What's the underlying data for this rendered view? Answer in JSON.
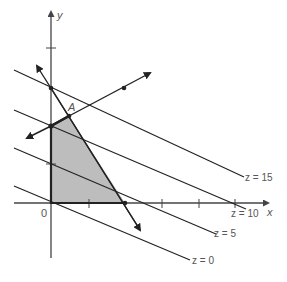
{
  "figure": {
    "colors": {
      "line": "#222222",
      "axis": "#444444",
      "region_fill": "#bdbdbd",
      "label": "#555555"
    },
    "axes": {
      "x_label": "x",
      "y_label": "y",
      "origin_label": "0"
    },
    "vertex_label": "A",
    "contours": [
      {
        "label": "z = 15",
        "value": 15
      },
      {
        "label": "z = 10",
        "value": 10
      },
      {
        "label": "z = 5",
        "value": 5
      },
      {
        "label": "z = 0",
        "value": 0
      }
    ]
  }
}
